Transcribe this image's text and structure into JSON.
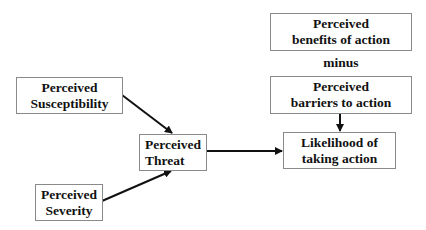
{
  "diagram": {
    "nodes": {
      "susceptibility": {
        "line1": "Perceived",
        "line2": "Susceptibility"
      },
      "severity": {
        "line1": "Perceived",
        "line2": "Severity"
      },
      "threat": {
        "line1": "Perceived",
        "line2": "Threat"
      },
      "benefits": {
        "line1": "Perceived",
        "line2": "benefits of action"
      },
      "barriers": {
        "line1": "Perceived",
        "line2": "barriers to action"
      },
      "likelihood": {
        "line1": "Likelihood of",
        "line2": "taking action"
      }
    },
    "operator_label": "minus",
    "edges": [
      {
        "from": "susceptibility",
        "to": "threat"
      },
      {
        "from": "severity",
        "to": "threat"
      },
      {
        "from": "threat",
        "to": "likelihood"
      },
      {
        "from": "barriers",
        "to": "likelihood"
      }
    ],
    "colors": {
      "box_border": "#8a8a8a",
      "text": "#111111",
      "arrow": "#111111",
      "background": "#ffffff"
    }
  }
}
